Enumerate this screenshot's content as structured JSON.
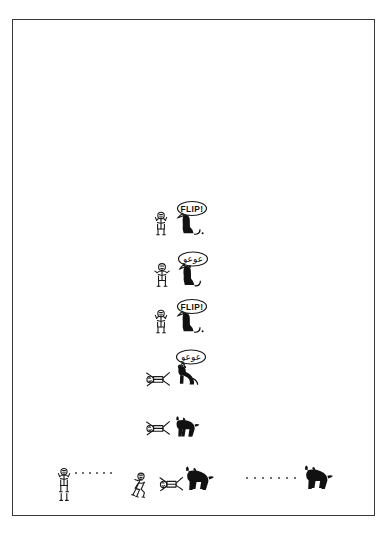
{
  "image": {
    "kind": "comic-strip",
    "medium": "scanned line drawing on white paper",
    "width": 389,
    "height": 533,
    "background_color": "#ffffff",
    "ink_color": "#1a1a1a",
    "frame": {
      "name": "paper-border",
      "color": "#3a3a3a",
      "style": "thin rectangular hand/printed border inset from page edge"
    }
  },
  "strip": {
    "title": "",
    "orientation": "vertical single column of panels, final panel horizontal",
    "characters": [
      {
        "id": "person",
        "label": "stick-figure person"
      },
      {
        "id": "dog",
        "label": "small black dog"
      }
    ],
    "panels": [
      {
        "index": 1,
        "name": "panel-command-flip-1",
        "speaker": "person",
        "bubble_text": "FLIP!",
        "bubble_language": "latin",
        "description": "Stick person stands and commands the seated black dog to flip.",
        "person_pose": "standing, arms raised",
        "dog_pose": "sitting, facing person"
      },
      {
        "index": 2,
        "name": "panel-dog-barks-1",
        "speaker": "dog",
        "bubble_text": "عوعو",
        "bubble_language": "arabic",
        "description": "The dog barks back instead of obeying.",
        "person_pose": "standing, arms out",
        "dog_pose": "sitting, head up barking"
      },
      {
        "index": 3,
        "name": "panel-command-flip-2",
        "speaker": "person",
        "bubble_text": "FLIP!",
        "bubble_language": "latin",
        "description": "Person repeats the command, more insistently.",
        "person_pose": "standing, arms raised",
        "dog_pose": "sitting, facing person"
      },
      {
        "index": 4,
        "name": "panel-person-flips",
        "speaker": "dog",
        "bubble_text": "عوعو",
        "bubble_language": "arabic",
        "description": "The person has flipped over onto the ground while the dog barks.",
        "person_pose": "tumbled over on back, legs up",
        "dog_pose": "standing over the person, barking"
      },
      {
        "index": 5,
        "name": "panel-dog-walks-away",
        "speaker": "",
        "bubble_text": "",
        "bubble_language": "",
        "description": "No speech. The dog trots away leaving the person on the ground.",
        "person_pose": "lying on the ground",
        "dog_pose": "walking away to the right"
      },
      {
        "index": 6,
        "name": "panel-final-sequence",
        "speaker": "",
        "bubble_text": "",
        "bubble_language": "",
        "description": "Wide final strip: person standing, then collapsing, then on the ground as the dog trots off along a dotted trail to the right.",
        "person_pose": "three stages: standing, buckling, fallen",
        "dog_pose": "two stages: leaving, far away at right",
        "motion_marks": "dotted trail lines"
      }
    ]
  }
}
